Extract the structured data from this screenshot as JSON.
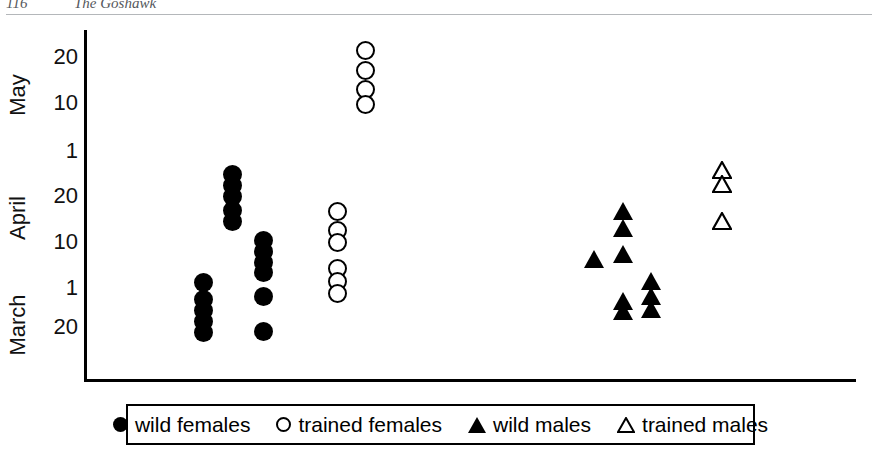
{
  "page_header": {
    "folio": "116",
    "running_title": "The Goshawk"
  },
  "legend": {
    "items": [
      {
        "glyph": "filled-circle-icon",
        "label": "wild females"
      },
      {
        "glyph": "open-circle-icon",
        "label": "trained females"
      },
      {
        "glyph": "filled-triangle-icon",
        "label": "wild males"
      },
      {
        "glyph": "open-triangle-icon",
        "label": "trained males"
      }
    ]
  },
  "chart_data": {
    "type": "scatter",
    "title": "",
    "xlabel": "",
    "ylabel": "",
    "grid": false,
    "legend_position": "bottom",
    "y_axis": {
      "description": "Date, increasing upward from late March through May",
      "month_groups": [
        "May",
        "April",
        "March"
      ],
      "tick_labels": [
        "20",
        "10",
        "1",
        "20",
        "10",
        "1",
        "20"
      ],
      "ticks": [
        {
          "label": "20",
          "month": "May",
          "y_px": 57
        },
        {
          "label": "10",
          "month": "May",
          "y_px": 103
        },
        {
          "label": "1",
          "month": "May",
          "y_px": 151
        },
        {
          "label": "20",
          "month": "April",
          "y_px": 196
        },
        {
          "label": "10",
          "month": "April",
          "y_px": 242
        },
        {
          "label": "1",
          "month": "April",
          "y_px": 288
        },
        {
          "label": "20",
          "month": "March",
          "y_px": 327
        }
      ],
      "month_label_positions": [
        {
          "label": "May",
          "y_px": 95
        },
        {
          "label": "April",
          "y_px": 218
        },
        {
          "label": "March",
          "y_px": 325
        }
      ]
    },
    "series": [
      {
        "name": "wild females",
        "marker": "filled-circle",
        "points": [
          {
            "x_px": 203,
            "y_px": 282
          },
          {
            "x_px": 203,
            "y_px": 299
          },
          {
            "x_px": 203,
            "y_px": 310
          },
          {
            "x_px": 203,
            "y_px": 321
          },
          {
            "x_px": 203,
            "y_px": 332
          },
          {
            "x_px": 232,
            "y_px": 174
          },
          {
            "x_px": 232,
            "y_px": 185
          },
          {
            "x_px": 232,
            "y_px": 196
          },
          {
            "x_px": 232,
            "y_px": 210
          },
          {
            "x_px": 232,
            "y_px": 221
          },
          {
            "x_px": 263,
            "y_px": 240
          },
          {
            "x_px": 263,
            "y_px": 251
          },
          {
            "x_px": 263,
            "y_px": 262
          },
          {
            "x_px": 263,
            "y_px": 272
          },
          {
            "x_px": 263,
            "y_px": 296
          },
          {
            "x_px": 263,
            "y_px": 331
          }
        ]
      },
      {
        "name": "trained females",
        "marker": "open-circle",
        "points": [
          {
            "x_px": 365,
            "y_px": 50
          },
          {
            "x_px": 365,
            "y_px": 70
          },
          {
            "x_px": 365,
            "y_px": 89
          },
          {
            "x_px": 365,
            "y_px": 104
          },
          {
            "x_px": 337,
            "y_px": 211
          },
          {
            "x_px": 337,
            "y_px": 230
          },
          {
            "x_px": 337,
            "y_px": 242
          },
          {
            "x_px": 337,
            "y_px": 268
          },
          {
            "x_px": 337,
            "y_px": 281
          },
          {
            "x_px": 337,
            "y_px": 293
          }
        ]
      },
      {
        "name": "wild males",
        "marker": "filled-triangle",
        "points": [
          {
            "x_px": 594,
            "y_px": 259
          },
          {
            "x_px": 623,
            "y_px": 211
          },
          {
            "x_px": 623,
            "y_px": 228
          },
          {
            "x_px": 623,
            "y_px": 254
          },
          {
            "x_px": 623,
            "y_px": 301
          },
          {
            "x_px": 623,
            "y_px": 311
          },
          {
            "x_px": 651,
            "y_px": 281
          },
          {
            "x_px": 651,
            "y_px": 296
          },
          {
            "x_px": 651,
            "y_px": 309
          }
        ]
      },
      {
        "name": "trained males",
        "marker": "open-triangle",
        "points": [
          {
            "x_px": 722,
            "y_px": 170
          },
          {
            "x_px": 722,
            "y_px": 184
          },
          {
            "x_px": 722,
            "y_px": 221
          }
        ]
      }
    ]
  }
}
